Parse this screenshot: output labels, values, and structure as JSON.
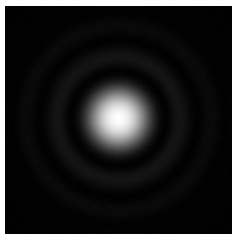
{
  "figure": {
    "canvas_width": 238,
    "canvas_height": 244,
    "background_color": "#ffffff"
  },
  "image_frame": {
    "name": "psf-image-frame",
    "x": 5,
    "y": 6,
    "width": 227,
    "height": 228,
    "background_color": "#000000",
    "border_color": "#ffffff"
  },
  "chart_data": {
    "type": "heatmap",
    "subtitle": "",
    "xlabel": "",
    "ylabel": "",
    "colormap": "gray",
    "grid": false,
    "legend": "none",
    "axes_visible": false,
    "tick_labels": [],
    "center_x": 113,
    "center_y": 112,
    "peak_intensity": 1.0,
    "background_intensity": 0.0,
    "noise_amplitude": 0.012,
    "core_radius": 33,
    "radial_profile": {
      "radius": [
        0,
        4,
        8,
        12,
        16,
        20,
        24,
        28,
        32,
        36,
        40,
        44,
        48,
        52,
        56,
        60,
        64,
        68,
        72,
        76,
        80,
        84,
        88,
        92,
        96,
        100,
        104,
        108,
        112
      ],
      "intensity": [
        1.0,
        0.985,
        0.94,
        0.87,
        0.77,
        0.64,
        0.5,
        0.355,
        0.225,
        0.12,
        0.048,
        0.012,
        0.002,
        0.018,
        0.046,
        0.062,
        0.058,
        0.04,
        0.02,
        0.006,
        0.002,
        0.01,
        0.022,
        0.027,
        0.024,
        0.014,
        0.005,
        0.002,
        0.006
      ]
    },
    "rings": [
      {
        "name": "central-airy-disk",
        "inner_radius": 0,
        "outer_radius": 40,
        "peak_radius": 0,
        "peak_intensity": 1.0,
        "color": "#ffffff"
      },
      {
        "name": "first-dark-minimum",
        "inner_radius": 40,
        "outer_radius": 50,
        "peak_radius": 45,
        "peak_intensity": 0.004,
        "color": "#010101"
      },
      {
        "name": "first-bright-ring",
        "inner_radius": 50,
        "outer_radius": 70,
        "peak_radius": 59,
        "peak_intensity": 0.063,
        "color": "#101010"
      },
      {
        "name": "second-dark-minimum",
        "inner_radius": 70,
        "outer_radius": 82,
        "peak_radius": 77,
        "peak_intensity": 0.003,
        "color": "#010101"
      },
      {
        "name": "second-bright-ring",
        "inner_radius": 82,
        "outer_radius": 104,
        "peak_radius": 92,
        "peak_intensity": 0.028,
        "color": "#070707"
      },
      {
        "name": "third-dark-minimum",
        "inner_radius": 104,
        "outer_radius": 112,
        "peak_radius": 108,
        "peak_intensity": 0.002,
        "color": "#000000"
      },
      {
        "name": "third-bright-ring",
        "inner_radius": 112,
        "outer_radius": 135,
        "peak_radius": 122,
        "peak_intensity": 0.013,
        "color": "#040404"
      }
    ]
  }
}
